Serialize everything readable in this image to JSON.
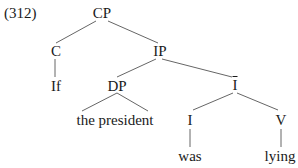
{
  "example_number": "(312)",
  "tree": {
    "nodes": {
      "cp": "CP",
      "c": "C",
      "if": "If",
      "ip": "IP",
      "dp": "DP",
      "the_president": "the president",
      "ibar": "I",
      "i": "I",
      "was": "was",
      "v": "V",
      "lying": "lying"
    },
    "line_color": "#555555"
  }
}
